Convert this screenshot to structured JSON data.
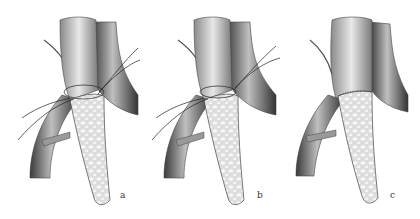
{
  "figure": {
    "panels": [
      {
        "id": "a",
        "label": "a",
        "stage": "sutures placed, anastomosis open"
      },
      {
        "id": "b",
        "label": "b",
        "stage": "sutures tightened"
      },
      {
        "id": "c",
        "label": "c",
        "stage": "anastomosis completed"
      }
    ],
    "colors": {
      "vessel_light": "#bdbdbd",
      "vessel_dark": "#6e6e6e",
      "graft": "#e6e6e6",
      "outline": "#444444",
      "suture": "#222222"
    }
  }
}
